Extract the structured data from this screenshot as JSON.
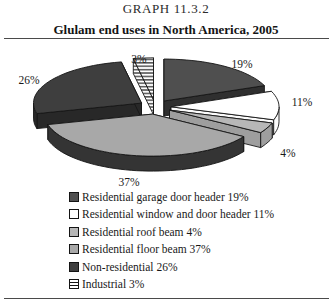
{
  "page": {
    "title": "GRAPH 11.3.2",
    "subtitle": "Glulam end uses in North America, 2005"
  },
  "chart_data": {
    "type": "pie",
    "style": "3d-exploded",
    "title": "Glulam end uses in North America, 2005",
    "unit": "%",
    "start_angle_deg": 0,
    "direction": "clockwise",
    "legend_position": "bottom-left",
    "slices": [
      {
        "name": "Residential garage door header",
        "value": 19,
        "callout": "19%",
        "legend": "Residential garage door header 19%",
        "color": "#4f4f4f",
        "side_color": "#2f2f2f",
        "pattern": "solid"
      },
      {
        "name": "Residential window and door header",
        "value": 11,
        "callout": "11%",
        "legend": "Residential window and door header 11%",
        "color": "#ffffff",
        "side_color": "#fbfbfb",
        "pattern": "solid"
      },
      {
        "name": "Residential roof beam",
        "value": 4,
        "callout": "4%",
        "legend": "Residential roof beam 4%",
        "color": "#b7b7b7",
        "side_color": "#9e9e9e",
        "pattern": "solid"
      },
      {
        "name": "Residential floor beam",
        "value": 37,
        "callout": "37%",
        "legend": "Residential floor beam 37%",
        "color": "#a8a8a8",
        "side_color": "#343434",
        "pattern": "solid"
      },
      {
        "name": "Non-residential",
        "value": 26,
        "callout": "26%",
        "legend": "Non-residential 26%",
        "color": "#3e3e3e",
        "side_color": "#282828",
        "pattern": "solid"
      },
      {
        "name": "Industrial",
        "value": 3,
        "callout": "3%",
        "legend": "Industrial 3%",
        "color": "#ffffff",
        "side_color": "#ffffff",
        "pattern": "horizontal-hatch"
      }
    ]
  }
}
